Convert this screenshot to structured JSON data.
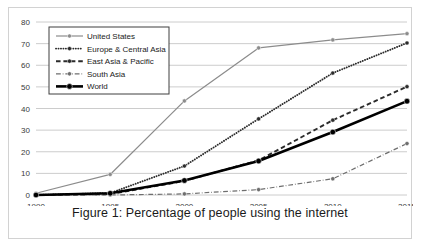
{
  "figure": {
    "caption": "Figure 1: Percentage of people using the internet"
  },
  "chart_data": {
    "type": "line",
    "title": "Figure 1: Percentage of people using the internet",
    "xlabel": "",
    "ylabel": "",
    "x": [
      1990,
      1995,
      2000,
      2005,
      2010,
      2015
    ],
    "categories": [
      "1990",
      "1995",
      "2000",
      "2005",
      "2010",
      "2015"
    ],
    "xlim": [
      1990,
      2015
    ],
    "ylim": [
      0,
      80
    ],
    "yticks": [
      0,
      10,
      20,
      30,
      40,
      50,
      60,
      70,
      80
    ],
    "xticks": [
      "1990",
      "1995",
      "2000",
      "2005",
      "2010",
      "2015"
    ],
    "grid": "horizontal",
    "legend_position": "top-left",
    "series": [
      {
        "name": "United States",
        "values": [
          0.8,
          9.5,
          43.5,
          68.0,
          71.7,
          74.6
        ],
        "color": "#8c8c8c",
        "style": "solid",
        "width": 1.2,
        "marker": "circle"
      },
      {
        "name": "Europe & Central Asia",
        "values": [
          0.0,
          0.9,
          13.4,
          35.2,
          56.4,
          70.3
        ],
        "color": "#2b2b2b",
        "style": "dotted",
        "width": 1.9,
        "marker": "circle"
      },
      {
        "name": "East Asia & Pacific",
        "values": [
          0.0,
          0.4,
          6.5,
          16.0,
          34.6,
          50.1
        ],
        "color": "#2b2b2b",
        "style": "dashed",
        "width": 1.9,
        "marker": "circle"
      },
      {
        "name": "South Asia",
        "values": [
          0.0,
          0.0,
          0.5,
          2.5,
          7.5,
          23.8
        ],
        "color": "#6e6e6e",
        "style": "dashdot",
        "width": 1.2,
        "marker": "circle"
      },
      {
        "name": "World",
        "values": [
          0.0,
          0.8,
          6.7,
          15.7,
          29.1,
          43.4
        ],
        "color": "#000000",
        "style": "solid",
        "width": 2.6,
        "marker": "circle"
      }
    ]
  },
  "axes": {
    "grid_color": "#bfbfbf",
    "tick_color": "#3a3a3a"
  },
  "legend": {
    "border_color": "#3f3f3f",
    "background": "#ffffff"
  }
}
